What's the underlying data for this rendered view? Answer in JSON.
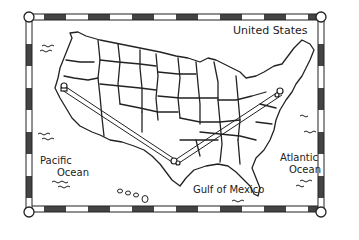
{
  "map": {
    "title": "United States",
    "colors": {
      "ink": "#222222",
      "background": "#ffffff",
      "border_dark": "#333333",
      "border_light": "#ffffff"
    },
    "labels": {
      "pacific_line1": "Pacific",
      "pacific_line2": "Ocean",
      "atlantic_line1": "Atlantic",
      "atlantic_line2": "Ocean",
      "gulf": "Gulf of Mexico"
    },
    "route": {
      "points": [
        {
          "name": "west-coast-marker",
          "x": 64,
          "y": 88
        },
        {
          "name": "gulf-coast-marker",
          "x": 174,
          "y": 163
        },
        {
          "name": "east-coast-marker",
          "x": 280,
          "y": 92
        }
      ]
    }
  }
}
